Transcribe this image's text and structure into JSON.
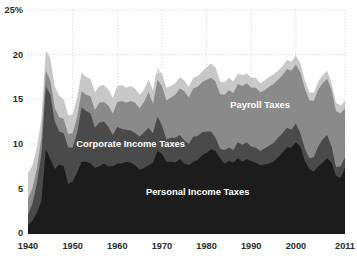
{
  "chart_data": {
    "type": "area",
    "stacked": true,
    "title": "",
    "subtitle": "",
    "xlabel": "",
    "ylabel": "",
    "ylim": [
      0,
      25
    ],
    "xlim": [
      1940,
      2011
    ],
    "grid": true,
    "legend_position": "inline-labels",
    "ytick_labels": [
      "25%",
      "20",
      "15",
      "10",
      "5",
      "0"
    ],
    "ytick_values": [
      25,
      20,
      15,
      10,
      5,
      0
    ],
    "xtick_labels": [
      "1940",
      "1950",
      "1960",
      "1970",
      "1980",
      "1990",
      "2000",
      "2011"
    ],
    "xtick_values": [
      1940,
      1950,
      1960,
      1970,
      1980,
      1990,
      2000,
      2011
    ],
    "colors": {
      "personal_income_taxes": "#1c1c1c",
      "corporate_income_taxes": "#4a4a4a",
      "payroll_taxes": "#8a8a8a",
      "other": "#c8c8c8",
      "gridline": "#c9c9c9",
      "axis": "#1a1a1a",
      "text": "#2b2b2b",
      "label_text": "#ffffff",
      "background": "#ffffff"
    },
    "x": [
      1940,
      1941,
      1942,
      1943,
      1944,
      1945,
      1946,
      1947,
      1948,
      1949,
      1950,
      1951,
      1952,
      1953,
      1954,
      1955,
      1956,
      1957,
      1958,
      1959,
      1960,
      1961,
      1962,
      1963,
      1964,
      1965,
      1966,
      1967,
      1968,
      1969,
      1970,
      1971,
      1972,
      1973,
      1974,
      1975,
      1976,
      1977,
      1978,
      1979,
      1980,
      1981,
      1982,
      1983,
      1984,
      1985,
      1986,
      1987,
      1988,
      1989,
      1990,
      1991,
      1992,
      1993,
      1994,
      1995,
      1996,
      1997,
      1998,
      1999,
      2000,
      2001,
      2002,
      2003,
      2004,
      2005,
      2006,
      2007,
      2008,
      2009,
      2010,
      2011
    ],
    "series": [
      {
        "name": "Personal Income Taxes",
        "label": "Personal Income Taxes",
        "color": "#1c1c1c",
        "values": [
          0.9,
          1.4,
          2.3,
          3.6,
          9.4,
          8.3,
          7.2,
          7.7,
          7.5,
          5.5,
          5.8,
          6.8,
          8.0,
          8.0,
          7.8,
          7.3,
          7.5,
          7.8,
          7.5,
          7.5,
          7.8,
          7.8,
          8.0,
          7.9,
          7.6,
          7.1,
          7.3,
          7.6,
          7.9,
          9.2,
          8.9,
          8.0,
          8.0,
          7.9,
          8.3,
          7.8,
          7.6,
          8.0,
          8.2,
          8.7,
          9.0,
          9.4,
          9.2,
          8.4,
          7.8,
          8.1,
          7.9,
          8.4,
          8.0,
          8.3,
          8.1,
          7.9,
          7.6,
          7.7,
          7.8,
          8.0,
          8.5,
          9.0,
          9.6,
          9.6,
          10.2,
          9.7,
          8.1,
          7.2,
          6.9,
          7.5,
          7.9,
          8.4,
          7.9,
          6.4,
          6.2,
          7.3
        ]
      },
      {
        "name": "Corporate Income Taxes",
        "label": "Corporate Income Taxes",
        "color": "#4a4a4a",
        "values": [
          1.2,
          1.9,
          3.3,
          5.3,
          7.1,
          7.2,
          5.3,
          3.7,
          3.7,
          4.1,
          3.8,
          4.4,
          6.1,
          5.7,
          5.6,
          4.5,
          4.9,
          4.7,
          4.4,
          3.5,
          4.1,
          3.9,
          3.6,
          3.6,
          3.6,
          3.7,
          4.0,
          4.2,
          3.3,
          3.9,
          3.2,
          2.5,
          2.7,
          2.8,
          2.7,
          2.6,
          2.4,
          2.8,
          2.7,
          2.6,
          2.4,
          2.0,
          1.5,
          1.1,
          1.5,
          1.5,
          1.4,
          1.8,
          1.9,
          1.9,
          1.6,
          1.7,
          1.6,
          1.8,
          2.0,
          2.1,
          2.2,
          2.2,
          2.2,
          2.0,
          2.1,
          1.5,
          1.4,
          1.2,
          1.6,
          2.2,
          2.6,
          2.6,
          1.8,
          1.0,
          1.3,
          1.2
        ]
      },
      {
        "name": "Payroll Taxes",
        "label": "Payroll Taxes",
        "color": "#8a8a8a",
        "values": [
          1.8,
          1.7,
          1.7,
          1.8,
          1.7,
          1.6,
          1.5,
          1.6,
          1.6,
          1.5,
          1.6,
          1.8,
          1.8,
          1.8,
          1.9,
          2.0,
          2.2,
          2.2,
          2.4,
          2.4,
          2.8,
          3.1,
          3.0,
          3.3,
          3.4,
          3.2,
          3.4,
          4.0,
          3.3,
          4.1,
          4.4,
          4.4,
          4.5,
          4.8,
          5.2,
          5.5,
          5.2,
          5.4,
          5.5,
          5.6,
          5.8,
          6.0,
          6.3,
          6.1,
          6.2,
          6.4,
          6.4,
          6.5,
          6.6,
          6.6,
          6.6,
          6.7,
          6.6,
          6.5,
          6.6,
          6.6,
          6.5,
          6.5,
          6.6,
          6.6,
          6.6,
          6.8,
          6.7,
          6.5,
          6.3,
          6.4,
          6.3,
          6.3,
          6.3,
          6.3,
          5.9,
          5.5
        ]
      },
      {
        "name": "Other",
        "label": "Other",
        "color": "#c8c8c8",
        "values": [
          2.8,
          2.6,
          2.3,
          2.1,
          2.3,
          2.5,
          2.4,
          2.4,
          2.2,
          2.1,
          2.1,
          2.2,
          2.1,
          2.0,
          2.0,
          2.0,
          1.9,
          1.9,
          1.8,
          1.7,
          1.8,
          1.8,
          1.7,
          1.7,
          1.6,
          1.5,
          1.4,
          1.4,
          1.5,
          1.5,
          1.4,
          1.4,
          1.3,
          1.3,
          1.3,
          1.2,
          1.2,
          1.2,
          1.2,
          1.2,
          1.4,
          1.6,
          1.6,
          1.4,
          1.4,
          1.4,
          1.3,
          1.2,
          1.2,
          1.1,
          1.1,
          1.1,
          1.0,
          1.1,
          1.1,
          1.1,
          1.0,
          1.0,
          1.0,
          1.0,
          1.0,
          1.0,
          0.9,
          0.9,
          0.9,
          0.9,
          0.9,
          0.9,
          0.8,
          0.9,
          0.9,
          0.8
        ]
      }
    ],
    "inline_labels": [
      {
        "text": "Other",
        "x": 1969,
        "y": 18.0,
        "series": "Other"
      },
      {
        "text": "Payroll Taxes",
        "x": 1992,
        "y": 14.0,
        "series": "Payroll Taxes"
      },
      {
        "text": "Corporate Income Taxes",
        "x": 1963,
        "y": 9.6,
        "series": "Corporate Income Taxes"
      },
      {
        "text": "Personal Income Taxes",
        "x": 1978,
        "y": 4.3,
        "series": "Personal Income Taxes"
      }
    ]
  }
}
